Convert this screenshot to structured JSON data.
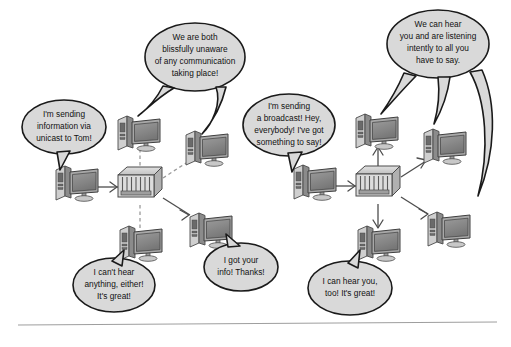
{
  "figure": {
    "background_color": "#ffffff",
    "bubble_fill": "#d9d9d9",
    "bubble_stroke": "#1a1a1a",
    "link_solid_color": "#4d4d4d",
    "link_dashed_color": "#9a9a9a",
    "rule_color": "#9e9e9e"
  },
  "left_panel": {
    "name": "unicast-network",
    "switch_label": "network-switch",
    "computer_count": 5,
    "bubbles": [
      {
        "id": "unicast-sender",
        "lines": [
          "I'm sending",
          "information via",
          "unicast to Tom!"
        ],
        "tails": 1
      },
      {
        "id": "unaware-pair",
        "lines": [
          "We are both",
          "blissfully unaware",
          "of any communication",
          "taking place!"
        ],
        "tails": 2
      },
      {
        "id": "cant-hear",
        "lines": [
          "I can't hear",
          "anything, either!",
          "It's great!"
        ],
        "tails": 1
      },
      {
        "id": "got-your-info",
        "lines": [
          "I got your",
          "info! Thanks!"
        ],
        "tails": 1
      }
    ]
  },
  "right_panel": {
    "name": "broadcast-network",
    "switch_label": "network-switch",
    "computer_count": 5,
    "bubbles": [
      {
        "id": "broadcast-sender",
        "lines": [
          "I'm sending",
          "a broadcast! Hey,",
          "everybody! I've got",
          "something to say!"
        ],
        "tails": 1
      },
      {
        "id": "we-can-hear",
        "lines": [
          "We can hear",
          "you and are listening",
          "intently to all you",
          "have to say."
        ],
        "tails": 3
      },
      {
        "id": "can-hear-too",
        "lines": [
          "I can hear you,",
          "too! It's great!"
        ],
        "tails": 1
      }
    ]
  }
}
